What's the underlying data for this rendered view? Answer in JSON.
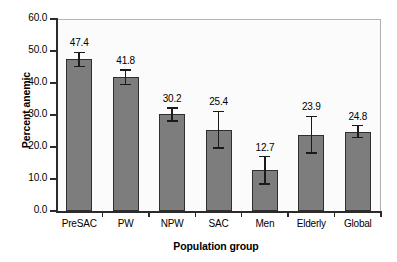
{
  "chart_data": {
    "type": "bar",
    "title": "",
    "subtitle": "",
    "xlabel": "Population group",
    "ylabel": "Percent anemic",
    "categories": [
      "PreSAC",
      "PW",
      "NPW",
      "SAC",
      "Men",
      "Elderly",
      "Global"
    ],
    "values": [
      47.4,
      41.8,
      30.2,
      25.4,
      12.7,
      23.9,
      24.8
    ],
    "value_labels": [
      "47.4",
      "41.8",
      "30.2",
      "25.4",
      "12.7",
      "23.9",
      "24.8"
    ],
    "errors_low": [
      2.2,
      2.2,
      2.0,
      5.7,
      4.3,
      5.7,
      1.9
    ],
    "errors_high": [
      2.2,
      2.2,
      2.0,
      5.7,
      4.3,
      5.7,
      1.9
    ],
    "ylim": [
      0.0,
      60.0
    ],
    "ytick_values": [
      0.0,
      10.0,
      20.0,
      30.0,
      40.0,
      50.0,
      60.0
    ],
    "ytick_labels": [
      "0.0",
      "10.0",
      "20.0",
      "30.0",
      "40.0",
      "50.0",
      "60.0"
    ],
    "grid": false,
    "legend": null,
    "bar_color": "#7d7d7d",
    "bar_edge_color": "#2f2f2f",
    "error_bar_color": "#1a1a1a",
    "axis_color": "#2b2b2b",
    "plot_background": "#fbfbfb",
    "figure_background": "#ffffff"
  }
}
